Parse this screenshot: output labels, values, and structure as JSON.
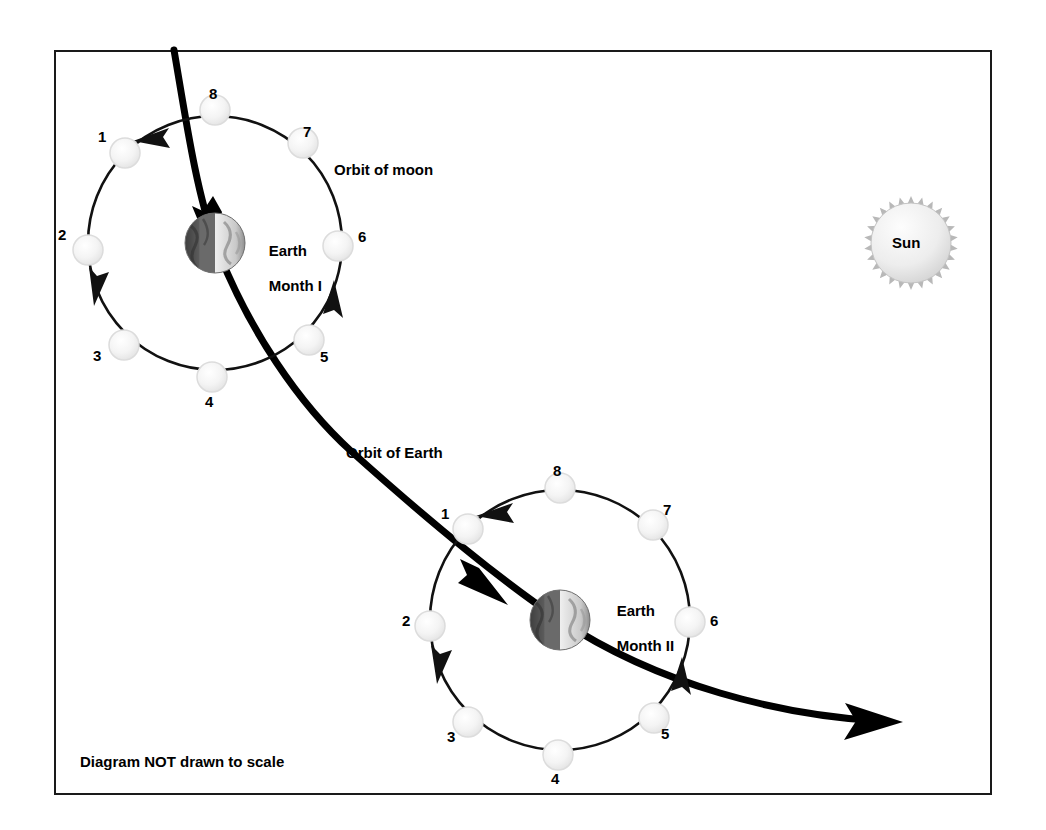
{
  "diagram": {
    "footnote": "Diagram NOT drawn to scale",
    "labels": {
      "orbit_of_moon": "Orbit of moon",
      "orbit_of_earth": "Orbit of Earth",
      "sun": "Sun"
    },
    "colors": {
      "frame": "#1a1a1a",
      "background": "#ffffff",
      "orbit_line": "#111111",
      "earth_path": "#000000",
      "moon_fill": "#f2f2f2",
      "moon_stroke": "#d8d8d8",
      "earth_dark": "#4a4a4a",
      "earth_light": "#d9d9d9",
      "sun_fill": "#e8e8e8",
      "sun_corona": "#b5b5b5"
    },
    "systems": [
      {
        "id": "month-1",
        "earth_label_line1": "Earth",
        "earth_label_line2": "Month I",
        "center": {
          "x": 215,
          "y": 243
        },
        "radius": 127,
        "earth_radius": 30,
        "moons": [
          {
            "n": "1",
            "angle_deg": 135
          },
          {
            "n": "2",
            "angle_deg": 183
          },
          {
            "n": "3",
            "angle_deg": 226
          },
          {
            "n": "4",
            "angle_deg": 272
          },
          {
            "n": "5",
            "angle_deg": 315
          },
          {
            "n": "6",
            "angle_deg": 357
          },
          {
            "n": "7",
            "angle_deg": 46
          },
          {
            "n": "8",
            "angle_deg": 93
          }
        ]
      },
      {
        "id": "month-2",
        "earth_label_line1": "Earth",
        "earth_label_line2": "Month II",
        "center": {
          "x": 560,
          "y": 620
        },
        "radius": 130,
        "earth_radius": 30,
        "moons": [
          {
            "n": "1",
            "angle_deg": 135
          },
          {
            "n": "2",
            "angle_deg": 183
          },
          {
            "n": "3",
            "angle_deg": 226
          },
          {
            "n": "4",
            "angle_deg": 272
          },
          {
            "n": "5",
            "angle_deg": 315
          },
          {
            "n": "6",
            "angle_deg": 357
          },
          {
            "n": "7",
            "angle_deg": 46
          },
          {
            "n": "8",
            "angle_deg": 93
          }
        ]
      }
    ],
    "sun": {
      "x": 911,
      "y": 243,
      "radius": 42
    },
    "moon_order_direction": "counterclockwise",
    "earth_path_direction": "top-left to bottom-right"
  }
}
